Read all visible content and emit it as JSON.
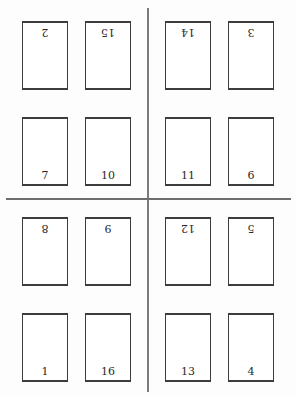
{
  "diagram": {
    "title": "",
    "type": "imposition-layout",
    "divider_color": "#6e6e6e",
    "border_color": "#3c3c3c",
    "quadrants": [
      {
        "name": "top-left",
        "pages": [
          {
            "number": "2",
            "orientation": "inverted"
          },
          {
            "number": "15",
            "orientation": "inverted"
          },
          {
            "number": "7",
            "orientation": "upright"
          },
          {
            "number": "10",
            "orientation": "upright"
          }
        ]
      },
      {
        "name": "top-right",
        "pages": [
          {
            "number": "14",
            "orientation": "inverted"
          },
          {
            "number": "3",
            "orientation": "inverted"
          },
          {
            "number": "11",
            "orientation": "upright"
          },
          {
            "number": "6",
            "orientation": "upright"
          }
        ]
      },
      {
        "name": "bottom-left",
        "pages": [
          {
            "number": "8",
            "orientation": "inverted"
          },
          {
            "number": "9",
            "orientation": "inverted"
          },
          {
            "number": "1",
            "orientation": "upright"
          },
          {
            "number": "16",
            "orientation": "upright"
          }
        ]
      },
      {
        "name": "bottom-right",
        "pages": [
          {
            "number": "12",
            "orientation": "inverted"
          },
          {
            "number": "5",
            "orientation": "inverted"
          },
          {
            "number": "13",
            "orientation": "upright"
          },
          {
            "number": "4",
            "orientation": "upright"
          }
        ]
      }
    ]
  }
}
